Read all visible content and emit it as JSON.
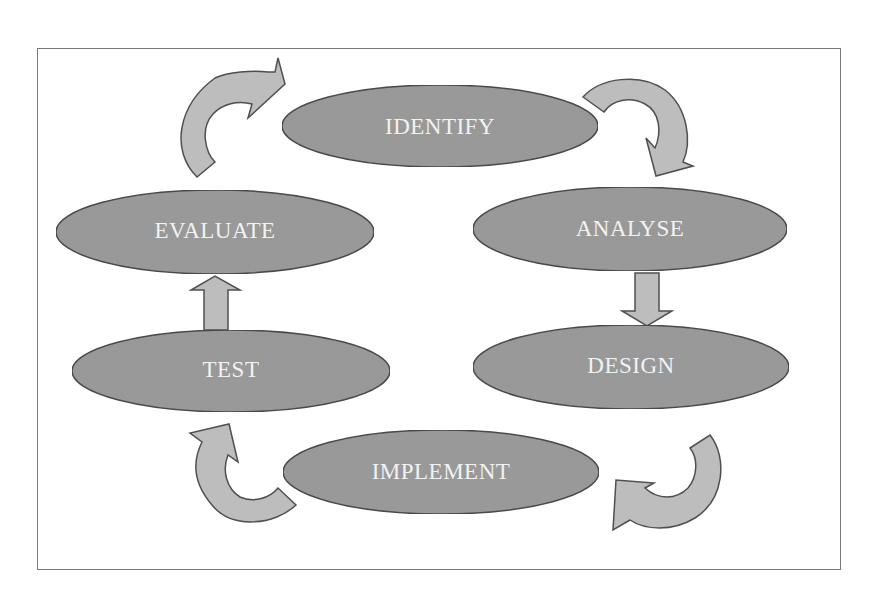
{
  "diagram": {
    "type": "cycle",
    "colors": {
      "node_fill": "#9a9a9a",
      "node_stroke": "#4a4a4a",
      "arrow_fill": "#bdbdbd",
      "arrow_stroke": "#4f4f4f",
      "label": "#f2f2f2",
      "frame_border": "#7a7a7a"
    },
    "nodes": [
      {
        "id": "identify",
        "label": "IDENTIFY"
      },
      {
        "id": "analyse",
        "label": "ANALYSE"
      },
      {
        "id": "design",
        "label": "DESIGN"
      },
      {
        "id": "implement",
        "label": "IMPLEMENT"
      },
      {
        "id": "test",
        "label": "TEST"
      },
      {
        "id": "evaluate",
        "label": "EVALUATE"
      }
    ],
    "edges": [
      {
        "from": "identify",
        "to": "analyse",
        "style": "curved-arrow"
      },
      {
        "from": "analyse",
        "to": "design",
        "style": "block-arrow-down"
      },
      {
        "from": "design",
        "to": "implement",
        "style": "curved-arrow"
      },
      {
        "from": "implement",
        "to": "test",
        "style": "curved-arrow"
      },
      {
        "from": "test",
        "to": "evaluate",
        "style": "block-arrow-up"
      },
      {
        "from": "evaluate",
        "to": "identify",
        "style": "curved-arrow"
      }
    ]
  }
}
